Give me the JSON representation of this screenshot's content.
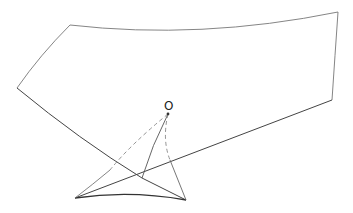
{
  "diagram": {
    "type": "geometric-projection",
    "labels": {
      "point_O": "O"
    },
    "colors": {
      "stroke": "#555555",
      "stroke_dark": "#333333",
      "dashed": "#888888",
      "background": "#ffffff"
    }
  }
}
